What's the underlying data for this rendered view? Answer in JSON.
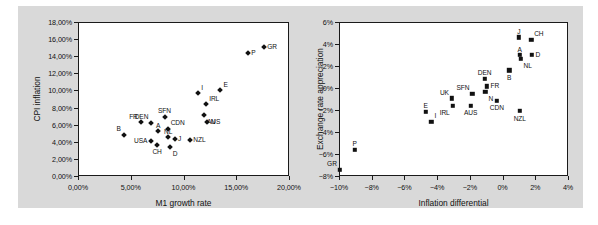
{
  "figure": {
    "background_color": "#d9d9d9",
    "plot_background_color": "#ffffff",
    "marker_color": "#111111"
  },
  "chart_data": [
    {
      "id": "m1-growth-vs-cpi-inflation",
      "type": "scatter",
      "title": "",
      "xlabel": "M1 growth rate",
      "ylabel": "CPI inflation",
      "xlim": [
        0,
        20
      ],
      "ylim": [
        0,
        18
      ],
      "xticks": [
        0,
        5,
        10,
        15,
        20
      ],
      "yticks": [
        0,
        2,
        4,
        6,
        8,
        10,
        12,
        14,
        16,
        18
      ],
      "xticklabels": [
        "0,00%",
        "5,00%",
        "10,00%",
        "15,00%",
        "20,00%"
      ],
      "yticklabels": [
        "0,00%",
        "2,00%",
        "4,00%",
        "6,00%",
        "8,00%",
        "10,00%",
        "12,00%",
        "14,00%",
        "16,00%",
        "18,00%"
      ],
      "grid": false,
      "legend": "none",
      "marker": "diamond",
      "points": [
        {
          "label": "B",
          "x": 4.35,
          "y": 4.85,
          "lpos": "above-left"
        },
        {
          "label": "FR",
          "x": 5.95,
          "y": 6.3,
          "lpos": "above-left"
        },
        {
          "label": "DEN",
          "x": 6.95,
          "y": 6.2,
          "lpos": "above-left"
        },
        {
          "label": "USA",
          "x": 6.9,
          "y": 4.1,
          "lpos": "left"
        },
        {
          "label": "SFN",
          "x": 8.2,
          "y": 6.95,
          "lpos": "above"
        },
        {
          "label": "CDN",
          "x": 8.5,
          "y": 5.55,
          "lpos": "above-right"
        },
        {
          "label": "A",
          "x": 7.6,
          "y": 5.25,
          "lpos": "above"
        },
        {
          "label": "CH",
          "x": 7.5,
          "y": 3.65,
          "lpos": "below"
        },
        {
          "label": "NL",
          "x": 8.55,
          "y": 4.55,
          "lpos": "above"
        },
        {
          "label": "D",
          "x": 8.7,
          "y": 3.4,
          "lpos": "below-right"
        },
        {
          "label": "J",
          "x": 9.15,
          "y": 4.3,
          "lpos": "right"
        },
        {
          "label": "NZL",
          "x": 10.6,
          "y": 4.25,
          "lpos": "right"
        },
        {
          "label": "I",
          "x": 11.4,
          "y": 9.65,
          "lpos": "above-right"
        },
        {
          "label": "IRL",
          "x": 12.15,
          "y": 8.4,
          "lpos": "above-right"
        },
        {
          "label": "AUS",
          "x": 11.95,
          "y": 7.15,
          "lpos": "below-right"
        },
        {
          "label": "N",
          "x": 12.25,
          "y": 6.35,
          "lpos": "right"
        },
        {
          "label": "E",
          "x": 13.5,
          "y": 10.0,
          "lpos": "above-right"
        },
        {
          "label": "P",
          "x": 16.1,
          "y": 14.4,
          "lpos": "right"
        },
        {
          "label": "GR",
          "x": 17.6,
          "y": 15.05,
          "lpos": "right"
        }
      ]
    },
    {
      "id": "inflation-differential-vs-exchange-rate-appreciation",
      "type": "scatter",
      "title": "",
      "xlabel": "Inflation differential",
      "ylabel": "Exchange rate appreciation",
      "xlim": [
        -10,
        4
      ],
      "ylim": [
        -8,
        6
      ],
      "xticks": [
        -10,
        -8,
        -6,
        -4,
        -2,
        0,
        2,
        4
      ],
      "yticks": [
        -8,
        -6,
        -4,
        -2,
        0,
        2,
        4,
        6
      ],
      "xticklabels": [
        "−10%",
        "−8%",
        "−6%",
        "−4%",
        "−2%",
        "0%",
        "2%",
        "4%"
      ],
      "yticklabels": [
        "−8%",
        "−6%",
        "−4%",
        "−2%",
        "0%",
        "2%",
        "4%",
        "6%"
      ],
      "grid": false,
      "legend": "none",
      "marker": "square",
      "points": [
        {
          "label": "GR",
          "x": -9.95,
          "y": -7.45,
          "lpos": "above-left"
        },
        {
          "label": "P",
          "x": -9.05,
          "y": -5.6,
          "lpos": "above"
        },
        {
          "label": "E",
          "x": -4.7,
          "y": -2.15,
          "lpos": "above"
        },
        {
          "label": "I",
          "x": -4.35,
          "y": -3.05,
          "lpos": "above-right"
        },
        {
          "label": "UK",
          "x": -3.1,
          "y": -0.95,
          "lpos": "above-left"
        },
        {
          "label": "IRL",
          "x": -3.05,
          "y": -1.6,
          "lpos": "below-left"
        },
        {
          "label": "SFN",
          "x": -1.85,
          "y": -0.5,
          "lpos": "above-left"
        },
        {
          "label": "AUS",
          "x": -1.95,
          "y": -1.6,
          "lpos": "below"
        },
        {
          "label": "DEN",
          "x": -1.1,
          "y": 0.85,
          "lpos": "above"
        },
        {
          "label": "FR",
          "x": -0.95,
          "y": 0.15,
          "lpos": "right"
        },
        {
          "label": "N",
          "x": -1.05,
          "y": -0.35,
          "lpos": "below-right"
        },
        {
          "label": "CDN",
          "x": -0.35,
          "y": -1.15,
          "lpos": "below"
        },
        {
          "label": "B",
          "x": 0.4,
          "y": 1.6,
          "lpos": "below"
        },
        {
          "label": "NZL",
          "x": 1.05,
          "y": -2.1,
          "lpos": "below"
        },
        {
          "label": "J",
          "x": 1.0,
          "y": 4.6,
          "lpos": "above"
        },
        {
          "label": "CH",
          "x": 1.75,
          "y": 4.4,
          "lpos": "above-right"
        },
        {
          "label": "A",
          "x": 1.05,
          "y": 3.0,
          "lpos": "above"
        },
        {
          "label": "NL",
          "x": 1.1,
          "y": 2.65,
          "lpos": "below-right"
        },
        {
          "label": "D",
          "x": 1.8,
          "y": 3.0,
          "lpos": "right"
        }
      ]
    }
  ]
}
